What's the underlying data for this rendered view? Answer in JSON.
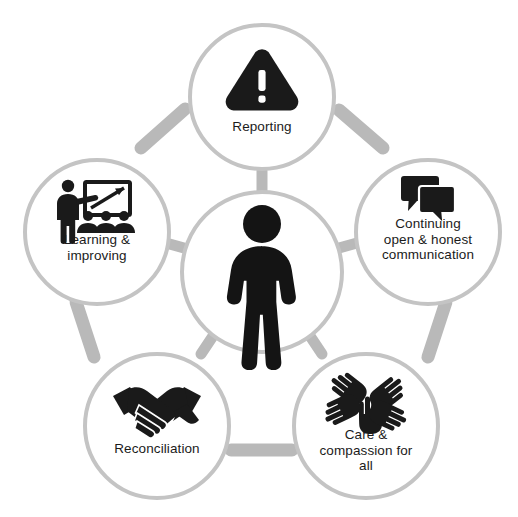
{
  "diagram": {
    "type": "hub-and-spoke pentagon cycle",
    "colors": {
      "ring": "#b9b9b9",
      "circle_outline": "#c4c4c4",
      "circle_fill": "#ffffff",
      "icon": "#1a1a1a",
      "label_text": "#1b1b1b",
      "background": "#ffffff"
    },
    "center": {
      "icon": "person-icon",
      "label": ""
    },
    "nodes": [
      {
        "id": "reporting",
        "label": "Reporting",
        "icon": "warning-triangle-icon",
        "position": "top"
      },
      {
        "id": "communication",
        "label": "Continuing\nopen &  honest\ncommunication",
        "icon": "speech-bubbles-icon",
        "position": "right"
      },
      {
        "id": "care",
        "label": "Care &\ncompassion for\nall",
        "icon": "helping-hands-icon",
        "position": "bottom-right"
      },
      {
        "id": "reconciliation",
        "label": "Reconciliation",
        "icon": "handshake-icon",
        "position": "bottom-left"
      },
      {
        "id": "learning",
        "label": "Learning &\nimproving",
        "icon": "teaching-whiteboard-icon",
        "position": "left"
      }
    ]
  }
}
